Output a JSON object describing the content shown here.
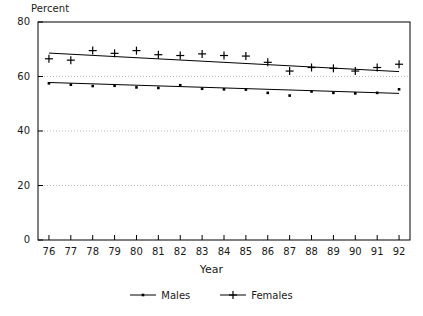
{
  "chart_data": {
    "type": "scatter",
    "title": "",
    "xlabel": "Year",
    "ylabel": "Percent",
    "x": [
      76,
      77,
      78,
      79,
      80,
      81,
      82,
      83,
      84,
      85,
      86,
      87,
      88,
      89,
      90,
      91,
      92
    ],
    "categories": [
      "76",
      "77",
      "78",
      "79",
      "80",
      "81",
      "82",
      "83",
      "84",
      "85",
      "86",
      "87",
      "88",
      "89",
      "90",
      "91",
      "92"
    ],
    "xlim": [
      75.5,
      92.5
    ],
    "ylim": [
      0,
      80
    ],
    "yticks": [
      0,
      20,
      40,
      60,
      80
    ],
    "xticks": [
      "76",
      "77",
      "78",
      "79",
      "80",
      "81",
      "82",
      "83",
      "84",
      "85",
      "86",
      "87",
      "88",
      "89",
      "90",
      "91",
      "92"
    ],
    "grid": "horizontal-dotted",
    "legend_position": "bottom-center",
    "series": [
      {
        "name": "Males",
        "marker": "dot",
        "color": "#000000",
        "values": [
          57.5,
          57.0,
          56.5,
          56.6,
          56.0,
          55.8,
          56.8,
          55.5,
          55.3,
          55.2,
          54.0,
          53.0,
          54.5,
          54.0,
          53.8,
          54.0,
          55.3
        ],
        "trend": {
          "start": 57.8,
          "end": 53.8
        }
      },
      {
        "name": "Females",
        "marker": "plus",
        "color": "#000000",
        "values": [
          66.5,
          66.0,
          69.5,
          68.5,
          69.5,
          68.0,
          67.7,
          68.3,
          67.7,
          67.5,
          65.2,
          62.0,
          63.3,
          63.0,
          62.0,
          63.3,
          64.5
        ],
        "trend": {
          "start": 68.6,
          "end": 61.8
        }
      }
    ]
  },
  "legend": {
    "items": [
      {
        "label": "Males",
        "marker": "dot"
      },
      {
        "label": "Females",
        "marker": "plus"
      }
    ]
  },
  "axes": {
    "y_title": "Percent",
    "x_title": "Year"
  },
  "colors": {
    "axis": "#000000",
    "grid": "#bdbdbd",
    "marker": "#000000",
    "trendline": "#000000"
  }
}
